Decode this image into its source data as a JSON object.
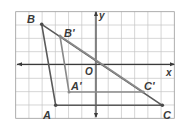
{
  "diagram": {
    "grid": {
      "cols": 12,
      "rows": 8,
      "origin_col": 6,
      "origin_row": 4,
      "left": 15.7,
      "top": 11.7,
      "right": 174.3,
      "bottom": 118.3,
      "grid_color": "#c4c4c4",
      "border_color": "#9a9a9a"
    },
    "axes": {
      "x_label": "x",
      "y_label": "y",
      "origin_label": "O",
      "axis_color": "#3a3a3a"
    },
    "triangle_original": {
      "color": "#5a5a5a",
      "points": {
        "A": {
          "label": "A",
          "coord": [
            -4,
            -3
          ]
        },
        "B": {
          "label": "B",
          "coord": [
            -5,
            3
          ]
        },
        "C": {
          "label": "C",
          "coord": [
            5,
            -3
          ]
        }
      }
    },
    "triangle_image": {
      "color": "#8a8a8a",
      "points": {
        "A'": {
          "label": "A'",
          "coord": [
            -2,
            -2
          ]
        },
        "B'": {
          "label": "B'",
          "coord": [
            -3.5,
            2
          ]
        },
        "C'": {
          "label": "C'",
          "coord": [
            3.5,
            -2
          ]
        }
      }
    },
    "labels": {
      "A": "A",
      "B": "B",
      "C": "C",
      "A_prime": "A'",
      "B_prime": "B'",
      "C_prime": "C'"
    }
  }
}
